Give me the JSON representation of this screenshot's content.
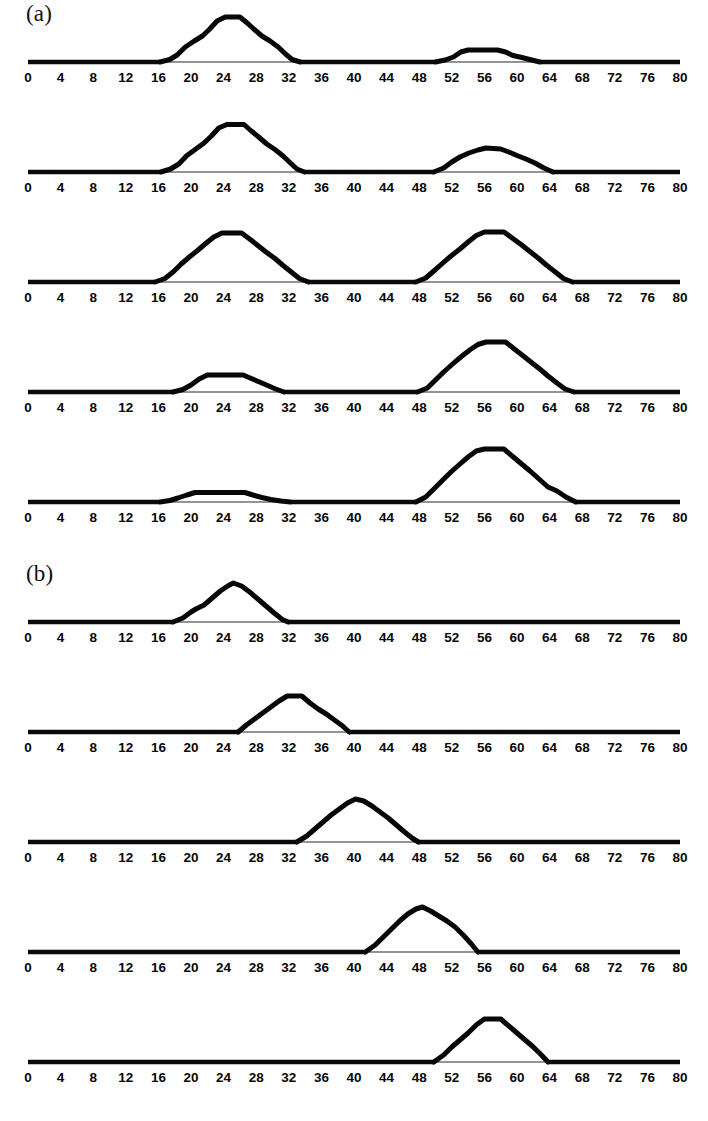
{
  "figure": {
    "panel_a_label": "(a)",
    "panel_b_label": "(b)",
    "axis_ticks": [
      0,
      4,
      8,
      12,
      16,
      20,
      24,
      28,
      32,
      36,
      40,
      44,
      48,
      52,
      56,
      60,
      64,
      68,
      72,
      76,
      80
    ],
    "axis_min": 0,
    "axis_max": 80,
    "line_color": "#070707",
    "background_color": "#ffffff"
  },
  "chart_data": {
    "type": "line",
    "title": "",
    "subtitle": "",
    "xlabel": "",
    "ylabel": "",
    "xlim": [
      0,
      80
    ],
    "ylim": [
      0,
      1.1
    ],
    "grid": false,
    "legend": null,
    "tick_step": 4,
    "tick_labels": [
      "0",
      "4",
      "8",
      "12",
      "16",
      "20",
      "24",
      "28",
      "32",
      "36",
      "40",
      "44",
      "48",
      "52",
      "56",
      "60",
      "64",
      "68",
      "72",
      "76",
      "80"
    ],
    "panels": [
      {
        "group": "a",
        "group_label": "(a)",
        "index": 0,
        "description": "Large trapezoidal pulse near x=24 and a small flat-topped pulse near x=56",
        "series": [
          {
            "name": "pulse-left",
            "x": [
              16.2,
              17.4,
              18.3,
              19.3,
              20.4,
              21.4,
              22.3,
              23.2,
              24.2,
              26.0,
              26.9,
              27.7,
              28.7,
              29.7,
              30.7,
              31.6,
              32.4,
              33.4
            ],
            "y": [
              0.0,
              0.05,
              0.14,
              0.3,
              0.42,
              0.52,
              0.66,
              0.82,
              0.9,
              0.9,
              0.78,
              0.66,
              0.52,
              0.42,
              0.3,
              0.16,
              0.05,
              0.0
            ]
          },
          {
            "name": "pulse-right",
            "x": [
              50.0,
              51.2,
              52.2,
              53.1,
              54.0,
              57.6,
              58.6,
              59.5,
              60.6,
              61.8,
              62.8
            ],
            "y": [
              0.0,
              0.04,
              0.1,
              0.2,
              0.24,
              0.24,
              0.2,
              0.13,
              0.09,
              0.04,
              0.0
            ]
          }
        ]
      },
      {
        "group": "a",
        "group_label": "",
        "index": 1,
        "description": "Large trapezoidal pulse near x=24 and a medium rounded pulse near x=56",
        "series": [
          {
            "name": "pulse-left",
            "x": [
              16.3,
              17.5,
              18.5,
              19.5,
              20.6,
              21.6,
              22.5,
              23.4,
              24.4,
              26.5,
              27.4,
              28.3,
              29.3,
              30.3,
              31.3,
              32.2,
              33.0,
              33.9
            ],
            "y": [
              0.0,
              0.06,
              0.16,
              0.33,
              0.46,
              0.58,
              0.72,
              0.88,
              0.95,
              0.95,
              0.82,
              0.7,
              0.56,
              0.45,
              0.32,
              0.18,
              0.06,
              0.0
            ]
          },
          {
            "name": "pulse-right",
            "x": [
              49.8,
              51.0,
              52.0,
              53.0,
              54.1,
              55.2,
              56.2,
              58.0,
              59.0,
              60.0,
              61.1,
              62.2,
              63.3,
              64.4
            ],
            "y": [
              0.0,
              0.08,
              0.2,
              0.3,
              0.38,
              0.44,
              0.48,
              0.46,
              0.4,
              0.33,
              0.26,
              0.18,
              0.08,
              0.0
            ]
          }
        ]
      },
      {
        "group": "a",
        "group_label": "",
        "index": 2,
        "description": "Two large trapezoidal pulses of comparable height near x=24 and x=56",
        "series": [
          {
            "name": "pulse-left",
            "x": [
              15.6,
              16.8,
              17.8,
              18.8,
              19.8,
              20.8,
              21.8,
              22.8,
              23.8,
              26.2,
              27.2,
              28.2,
              29.2,
              30.3,
              31.3,
              32.3,
              33.3,
              34.4
            ],
            "y": [
              0.0,
              0.07,
              0.2,
              0.36,
              0.5,
              0.63,
              0.77,
              0.9,
              0.98,
              0.98,
              0.86,
              0.73,
              0.6,
              0.47,
              0.33,
              0.2,
              0.07,
              0.0
            ]
          },
          {
            "name": "pulse-right",
            "x": [
              47.6,
              48.8,
              49.8,
              50.9,
              51.9,
              53.0,
              54.0,
              55.0,
              56.0,
              58.4,
              59.4,
              60.5,
              61.5,
              62.6,
              63.6,
              64.7,
              65.7,
              66.8
            ],
            "y": [
              0.0,
              0.08,
              0.22,
              0.38,
              0.52,
              0.66,
              0.8,
              0.93,
              1.0,
              1.0,
              0.88,
              0.75,
              0.62,
              0.48,
              0.34,
              0.2,
              0.07,
              0.0
            ]
          }
        ]
      },
      {
        "group": "a",
        "group_label": "",
        "index": 3,
        "description": "Small flat-topped pulse near x=24 and a large trapezoidal pulse near x=56",
        "series": [
          {
            "name": "pulse-left",
            "x": [
              17.8,
              19.0,
              20.0,
              21.0,
              22.0,
              26.4,
              27.4,
              28.4,
              29.4,
              30.4,
              31.4
            ],
            "y": [
              0.0,
              0.05,
              0.14,
              0.26,
              0.34,
              0.34,
              0.27,
              0.2,
              0.13,
              0.06,
              0.0
            ]
          },
          {
            "name": "pulse-right",
            "x": [
              47.8,
              49.0,
              50.0,
              51.0,
              52.1,
              53.1,
              54.2,
              55.2,
              56.2,
              58.6,
              59.6,
              60.7,
              61.7,
              62.8,
              63.8,
              64.9,
              65.9,
              67.0
            ],
            "y": [
              0.0,
              0.08,
              0.24,
              0.4,
              0.56,
              0.7,
              0.84,
              0.95,
              1.0,
              1.0,
              0.87,
              0.73,
              0.6,
              0.46,
              0.32,
              0.18,
              0.06,
              0.0
            ]
          }
        ]
      },
      {
        "group": "a",
        "group_label": "",
        "index": 4,
        "description": "Very small flat pulse near x=24 and a tall trapezoidal pulse near x=56",
        "series": [
          {
            "name": "pulse-left",
            "x": [
              16.2,
              17.4,
              18.4,
              19.5,
              20.5,
              26.6,
              27.6,
              28.7,
              29.8,
              31.0,
              32.2
            ],
            "y": [
              0.0,
              0.03,
              0.08,
              0.14,
              0.19,
              0.19,
              0.14,
              0.09,
              0.05,
              0.02,
              0.0
            ]
          },
          {
            "name": "pulse-right",
            "x": [
              47.6,
              48.8,
              49.8,
              50.9,
              51.9,
              53.0,
              54.0,
              55.0,
              56.0,
              58.4,
              59.4,
              60.5,
              61.6,
              62.7,
              63.8,
              64.9,
              66.0,
              67.2
            ],
            "y": [
              0.0,
              0.1,
              0.26,
              0.44,
              0.6,
              0.76,
              0.9,
              1.02,
              1.06,
              1.06,
              0.92,
              0.77,
              0.62,
              0.46,
              0.3,
              0.22,
              0.1,
              0.0
            ]
          }
        ]
      },
      {
        "group": "b",
        "group_label": "(b)",
        "index": 0,
        "description": "Single peaked pulse centered near x=25",
        "series": [
          {
            "name": "pulse",
            "x": [
              17.8,
              19.0,
              20.0,
              20.6,
              21.6,
              22.6,
              23.6,
              24.6,
              25.2,
              26.2,
              27.2,
              28.2,
              29.2,
              30.2,
              31.2,
              31.9
            ],
            "y": [
              0.0,
              0.08,
              0.2,
              0.26,
              0.34,
              0.48,
              0.62,
              0.73,
              0.78,
              0.72,
              0.6,
              0.46,
              0.32,
              0.18,
              0.05,
              0.0
            ]
          }
        ]
      },
      {
        "group": "b",
        "group_label": "",
        "index": 1,
        "description": "Single flat-topped pulse centered near x=32",
        "series": [
          {
            "name": "pulse",
            "x": [
              25.8,
              26.8,
              27.8,
              28.8,
              29.8,
              30.8,
              31.8,
              33.6,
              34.6,
              35.6,
              36.6,
              37.6,
              38.6,
              39.4
            ],
            "y": [
              0.0,
              0.14,
              0.26,
              0.38,
              0.5,
              0.62,
              0.72,
              0.72,
              0.58,
              0.46,
              0.36,
              0.24,
              0.12,
              0.0
            ]
          }
        ]
      },
      {
        "group": "b",
        "group_label": "",
        "index": 2,
        "description": "Single peaked pulse centered near x=40",
        "series": [
          {
            "name": "pulse",
            "x": [
              33.0,
              34.2,
              35.2,
              36.2,
              37.2,
              38.2,
              39.2,
              40.2,
              41.2,
              42.2,
              43.2,
              44.2,
              45.2,
              46.2,
              47.2,
              47.9
            ],
            "y": [
              0.0,
              0.12,
              0.26,
              0.4,
              0.54,
              0.66,
              0.78,
              0.86,
              0.82,
              0.72,
              0.6,
              0.48,
              0.34,
              0.2,
              0.07,
              0.0
            ]
          }
        ]
      },
      {
        "group": "b",
        "group_label": "",
        "index": 3,
        "description": "Single peaked pulse centered near x=48",
        "series": [
          {
            "name": "pulse",
            "x": [
              41.4,
              42.6,
              43.6,
              44.6,
              45.6,
              46.6,
              47.6,
              48.4,
              49.4,
              50.4,
              51.4,
              52.4,
              53.4,
              54.4,
              55.2
            ],
            "y": [
              0.0,
              0.14,
              0.3,
              0.46,
              0.62,
              0.76,
              0.86,
              0.9,
              0.82,
              0.72,
              0.62,
              0.5,
              0.34,
              0.16,
              0.0
            ]
          }
        ]
      },
      {
        "group": "b",
        "group_label": "",
        "index": 4,
        "description": "Single flat-topped pulse centered near x=57",
        "series": [
          {
            "name": "pulse",
            "x": [
              49.8,
              51.0,
              52.0,
              53.0,
              54.0,
              55.0,
              56.0,
              58.0,
              59.0,
              60.0,
              61.0,
              62.0,
              63.0,
              63.8
            ],
            "y": [
              0.0,
              0.14,
              0.3,
              0.44,
              0.58,
              0.74,
              0.86,
              0.86,
              0.72,
              0.58,
              0.44,
              0.3,
              0.14,
              0.0
            ]
          }
        ]
      }
    ]
  }
}
